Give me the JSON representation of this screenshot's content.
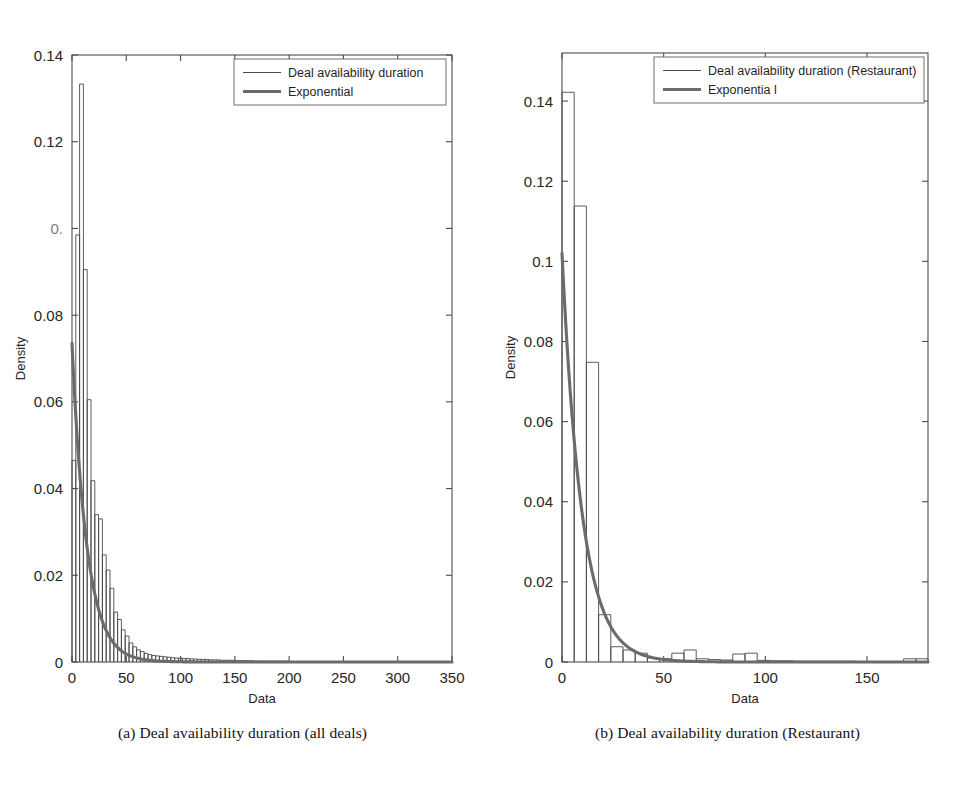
{
  "figure": {
    "background": "#ffffff",
    "width": 970,
    "height": 785
  },
  "panels": [
    {
      "id": "panel-a",
      "caption": "(a)  Deal availability duration (all deals)",
      "caption_label": "(a)",
      "xlabel": "Data",
      "ylabel": "Density",
      "legend_position": "top-right",
      "legend": [
        {
          "label": "Deal availability duration",
          "style": "thin",
          "color": "#4a4a4a"
        },
        {
          "label": "Exponential",
          "style": "thick",
          "color": "#6b6b6b"
        }
      ]
    },
    {
      "id": "panel-b",
      "caption": "(b)  Deal availability duration (Restaurant)",
      "caption_label": "(b)",
      "xlabel": "Data",
      "ylabel": "Density",
      "legend_position": "top-right",
      "legend": [
        {
          "label": "Deal availability duration (Restaurant)",
          "style": "thin",
          "color": "#4a4a4a"
        },
        {
          "label": "Exponentia l",
          "style": "thick",
          "color": "#6b6b6b"
        }
      ]
    }
  ],
  "chart_data": [
    {
      "type": "bar",
      "id": "panel-a",
      "title": "Deal availability duration (all deals)",
      "xlabel": "Data",
      "ylabel": "Density",
      "xlim": [
        0,
        350
      ],
      "ylim": [
        0,
        0.14
      ],
      "xticks": [
        0,
        50,
        100,
        150,
        200,
        250,
        300,
        350
      ],
      "xticklabels": [
        "0",
        "50",
        "100",
        "150",
        "200",
        "250",
        "300",
        "350"
      ],
      "yticks": [
        0,
        0.02,
        0.04,
        0.06,
        0.08,
        0.1,
        0.12,
        0.14
      ],
      "yticklabels": [
        "0",
        "0.02",
        "0.04",
        "0.06",
        "0.08",
        "0.",
        "0.12",
        "0.14"
      ],
      "grid": false,
      "legend_position": "upper right",
      "bin_width": 3.5,
      "series": [
        {
          "name": "Deal availability duration",
          "kind": "histogram",
          "bin_left_edges": [
            0,
            3.5,
            7,
            10.5,
            14,
            17.5,
            21,
            24.5,
            28,
            31.5,
            35,
            38.5,
            42,
            45.5,
            49,
            52.5,
            56,
            59.5,
            63,
            66.5,
            70,
            73.5,
            77,
            80.5,
            84,
            87.5,
            91,
            94.5,
            98,
            101.5,
            105,
            108.5,
            112,
            115.5,
            119,
            122.5,
            126,
            129.5,
            133,
            136.5,
            140,
            143.5,
            147,
            150.5,
            154,
            157.5,
            161,
            164.5,
            168,
            171.5,
            175,
            178.5,
            182,
            185.5,
            189,
            192.5,
            196,
            199.5,
            203,
            206.5,
            210,
            213.5,
            217,
            220.5,
            224,
            227.5,
            231,
            234.5,
            238,
            241.5,
            245,
            248.5,
            252,
            255.5,
            259,
            262.5,
            266,
            269.5,
            273,
            276.5,
            280,
            283.5,
            287,
            290.5,
            294,
            297.5,
            301,
            304.5,
            308,
            311.5,
            315,
            318.5,
            322,
            325.5,
            329,
            332.5,
            336,
            339.5,
            343,
            346.5
          ],
          "values": [
            0.0465,
            0.0985,
            0.1333,
            0.0905,
            0.0605,
            0.0418,
            0.034,
            0.033,
            0.0247,
            0.0212,
            0.017,
            0.0115,
            0.0098,
            0.0074,
            0.006,
            0.0044,
            0.0035,
            0.0028,
            0.0024,
            0.002,
            0.0017,
            0.0015,
            0.0014,
            0.0013,
            0.0012,
            0.0011,
            0.001,
            0.0009,
            0.0009,
            0.0008,
            0.0008,
            0.0007,
            0.0007,
            0.0006,
            0.0006,
            0.0006,
            0.0005,
            0.0005,
            0.0005,
            0.0004,
            0.0004,
            0.0004,
            0.0004,
            0.0003,
            0.0003,
            0.0003,
            0.0003,
            0.0003,
            0.0002,
            0.0002,
            0.0002,
            0.0002,
            0.0002,
            0.0002,
            0.0002,
            0.0002,
            0.0002,
            0.0001,
            0.0001,
            0.0001,
            0.0001,
            0.0001,
            0.0001,
            0.0001,
            0.0001,
            0.0001,
            0.0001,
            0.0001,
            0.0001,
            0.0001,
            0.0001,
            0.0001,
            0.0001,
            0.0001,
            0.0001,
            0.0001,
            0.0001,
            0.0001,
            0.0001,
            0.0001,
            0.0001,
            0.0001,
            0.0001,
            0.0001,
            0.0001,
            0.0001,
            0.0001,
            0.0001,
            0.0001,
            0.0001,
            0.0001,
            0.0001,
            0.0001,
            0.0001,
            0.0001,
            0.0001,
            0.0001,
            0.0001,
            0.0001,
            0.0001
          ]
        },
        {
          "name": "Exponential",
          "kind": "curve",
          "model": "exponential_pdf",
          "lambda": 0.0735,
          "scale": 13.6,
          "peak": 0.0735
        }
      ]
    },
    {
      "type": "bar",
      "id": "panel-b",
      "title": "Deal availability duration (Restaurant)",
      "xlabel": "Data",
      "ylabel": "Density",
      "xlim": [
        0,
        180
      ],
      "ylim": [
        0,
        0.152
      ],
      "xticks": [
        0,
        50,
        100,
        150
      ],
      "xticklabels": [
        "0",
        "50",
        "100",
        "150"
      ],
      "yticks": [
        0,
        0.02,
        0.04,
        0.06,
        0.08,
        0.1,
        0.12,
        0.14
      ],
      "yticklabels": [
        "0",
        "0.02",
        "0.04",
        "0.06",
        "0.08",
        "0.1",
        "0.12",
        "0.14"
      ],
      "grid": false,
      "legend_position": "upper right",
      "bin_width": 6,
      "series": [
        {
          "name": "Deal availability duration (Restaurant)",
          "kind": "histogram",
          "bin_left_edges": [
            0,
            6,
            12,
            18,
            24,
            30,
            36,
            42,
            48,
            54,
            60,
            66,
            72,
            78,
            84,
            90,
            96,
            102,
            108,
            114,
            120,
            126,
            132,
            138,
            144,
            150,
            156,
            162,
            168,
            174
          ],
          "values": [
            0.1422,
            0.1138,
            0.0748,
            0.0118,
            0.0038,
            0.003,
            0.0022,
            0.001,
            0.0008,
            0.0022,
            0.003,
            0.0008,
            0.0006,
            0.0005,
            0.002,
            0.0022,
            0.0004,
            0.0003,
            0.0003,
            0.0002,
            0.0002,
            0.0002,
            0.0002,
            0.0002,
            0.0001,
            0.0001,
            0.0001,
            0.0001,
            0.0008,
            0.0008
          ]
        },
        {
          "name": "Exponentia l",
          "kind": "curve",
          "model": "exponential_pdf",
          "lambda": 0.102,
          "scale": 9.8,
          "peak": 0.153
        }
      ]
    }
  ]
}
